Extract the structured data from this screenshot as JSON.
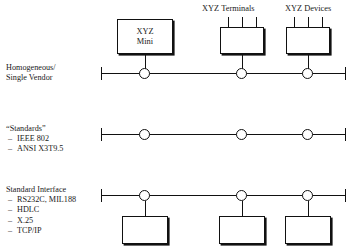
{
  "diagram": {
    "colors": {
      "line": "#111111",
      "text": "#1a1a1a",
      "background": "#ffffff"
    },
    "top_labels": [
      {
        "name": "xyz-terminals",
        "text": "XYZ Terminals"
      },
      {
        "name": "xyz-devices",
        "text": "XYZ Devices"
      }
    ],
    "mini_box": {
      "line1": "XYZ",
      "line2": "Mini"
    },
    "rows": [
      {
        "id": "homogeneous",
        "title": "Homogeneous/",
        "title2": "Single Vendor",
        "items": []
      },
      {
        "id": "standards",
        "title": "“Standards”",
        "items": [
          "IEEE 802",
          "ANSI X3T9.5"
        ]
      },
      {
        "id": "standard-interface",
        "title": "Standard Interface",
        "items": [
          "RS232C, MIL188",
          "HDLC",
          "X.25",
          "TCP/IP"
        ]
      }
    ]
  }
}
